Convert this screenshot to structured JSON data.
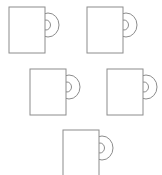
{
  "scene": {
    "title": "Mug outlines",
    "description": "Five identical coffee mug line drawings arranged in three rows",
    "width": 162,
    "height": 175,
    "background_color": "#ffffff",
    "stroke_color": "#8c8c8c",
    "stroke_width": 1,
    "item_count": 5,
    "item_label": "mug"
  },
  "rows": [
    {
      "index": 1,
      "count": 2
    },
    {
      "index": 2,
      "count": 2
    },
    {
      "index": 3,
      "count": 1
    }
  ],
  "mugs": [
    {
      "id": "mug-1",
      "label": "Mug 1",
      "row": 1,
      "column": 1,
      "body": {
        "x": 9,
        "y": 7,
        "width": 36,
        "height": 46
      },
      "handle": {
        "cx": 48,
        "cy": 25,
        "outer_rx": 11,
        "outer_ry": 12,
        "inner_rx": 4.5,
        "inner_ry": 5
      }
    },
    {
      "id": "mug-2",
      "label": "Mug 2",
      "row": 1,
      "column": 2,
      "body": {
        "x": 87,
        "y": 7,
        "width": 36,
        "height": 46
      },
      "handle": {
        "cx": 126,
        "cy": 25,
        "outer_rx": 11,
        "outer_ry": 12,
        "inner_rx": 4.5,
        "inner_ry": 5
      }
    },
    {
      "id": "mug-3",
      "label": "Mug 3",
      "row": 2,
      "column": 1,
      "body": {
        "x": 30,
        "y": 69,
        "width": 36,
        "height": 46
      },
      "handle": {
        "cx": 69,
        "cy": 87,
        "outer_rx": 11,
        "outer_ry": 12,
        "inner_rx": 4.5,
        "inner_ry": 5
      }
    },
    {
      "id": "mug-4",
      "label": "Mug 4",
      "row": 2,
      "column": 2,
      "body": {
        "x": 107,
        "y": 69,
        "width": 36,
        "height": 46
      },
      "handle": {
        "cx": 146,
        "cy": 87,
        "outer_rx": 11,
        "outer_ry": 12,
        "inner_rx": 4.5,
        "inner_ry": 5
      }
    },
    {
      "id": "mug-5",
      "label": "Mug 5",
      "row": 3,
      "column": 1,
      "body": {
        "x": 63,
        "y": 130,
        "width": 36,
        "height": 46
      },
      "handle": {
        "cx": 102,
        "cy": 148,
        "outer_rx": 11,
        "outer_ry": 12,
        "inner_rx": 4.5,
        "inner_ry": 5
      }
    }
  ]
}
